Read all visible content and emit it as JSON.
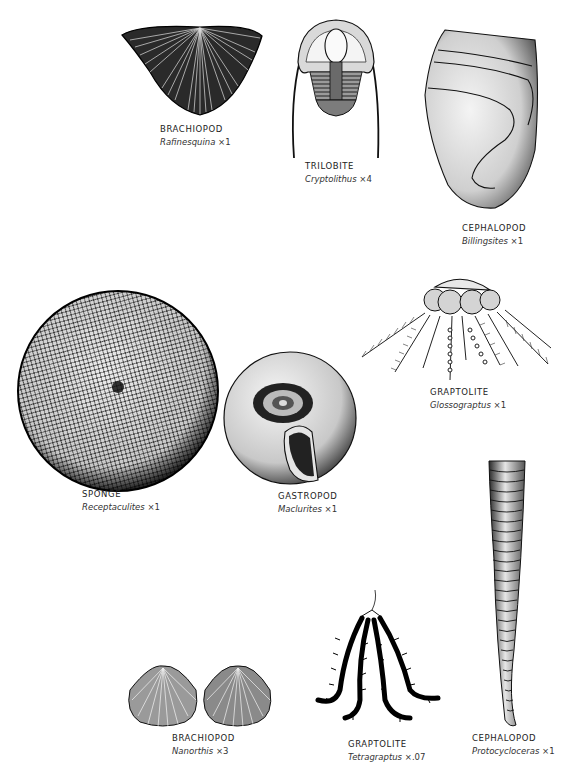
{
  "plate": {
    "background": "#ffffff",
    "ink": "#111111",
    "specimens": [
      {
        "id": "brachiopod-rafinesquina",
        "group": "BRACHIOPOD",
        "genus": "Rafinesquina",
        "magnification": "×1"
      },
      {
        "id": "trilobite-cryptolithus",
        "group": "TRILOBITE",
        "genus": "Cryptolithus",
        "magnification": "×4"
      },
      {
        "id": "cephalopod-billingsites",
        "group": "CEPHALOPOD",
        "genus": "Billingsites",
        "magnification": "×1"
      },
      {
        "id": "graptolite-glossograptus",
        "group": "GRAPTOLITE",
        "genus": "Glossograptus",
        "magnification": "×1"
      },
      {
        "id": "sponge-receptaculites",
        "group": "SPONGE",
        "genus": "Receptaculites",
        "magnification": "×1"
      },
      {
        "id": "gastropod-maclurites",
        "group": "GASTROPOD",
        "genus": "Maclurites",
        "magnification": "×1"
      },
      {
        "id": "cephalopod-protocycloceras",
        "group": "CEPHALOPOD",
        "genus": "Protocycloceras",
        "magnification": "×1"
      },
      {
        "id": "brachiopod-nanorthis",
        "group": "BRACHIOPOD",
        "genus": "Nanorthis",
        "magnification": "×3"
      },
      {
        "id": "graptolite-tetragraptus",
        "group": "GRAPTOLITE",
        "genus": "Tetragraptus",
        "magnification": "×.07"
      }
    ]
  }
}
